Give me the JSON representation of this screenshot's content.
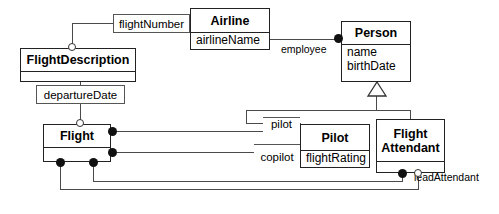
{
  "diagram": {
    "type": "uml-class-diagram",
    "background_color": "#ffffff",
    "line_color": "#4a4a4a",
    "border_color": "#222222"
  },
  "classes": [
    {
      "id": "airline",
      "name": "Airline",
      "attributes": [
        "airlineName"
      ],
      "x": 190,
      "y": 8,
      "w": 80,
      "h": 42,
      "name_h": 21
    },
    {
      "id": "person",
      "name": "Person",
      "attributes": [
        "name",
        "birthDate"
      ],
      "x": 341,
      "y": 21,
      "w": 70,
      "h": 61,
      "name_h": 20
    },
    {
      "id": "flightdescription",
      "name": "FlightDescription",
      "attributes": [],
      "x": 20,
      "y": 48,
      "w": 116,
      "h": 34,
      "name_h": 20
    },
    {
      "id": "flight",
      "name": "Flight",
      "attributes": [],
      "x": 43,
      "y": 124,
      "w": 68,
      "h": 38,
      "name_h": 20
    },
    {
      "id": "pilot",
      "name": "Pilot",
      "attributes": [
        "flightRating"
      ],
      "x": 300,
      "y": 124,
      "w": 70,
      "h": 44,
      "name_h": 23
    },
    {
      "id": "flightattendant",
      "name": "Flight\nAttendant",
      "attributes": [],
      "x": 376,
      "y": 119,
      "w": 69,
      "h": 54,
      "name_h": 39
    }
  ],
  "qualifier_boxes": [
    {
      "id": "flightnumber",
      "label": "flightNumber",
      "x": 113,
      "y": 14,
      "w": 77,
      "h": 19
    },
    {
      "id": "departuredate",
      "label": "departureDate",
      "x": 36,
      "y": 85,
      "w": 89,
      "h": 19
    },
    {
      "id": "pilot_role",
      "label": "pilot",
      "x": 263,
      "y": 117,
      "w": 37,
      "h": 16
    },
    {
      "id": "copilot_role",
      "label": "copilot",
      "x": 254,
      "y": 144,
      "w": 46,
      "h": 19
    }
  ],
  "association_labels": [
    {
      "id": "employee",
      "text": "employee",
      "x": 281,
      "y": 44
    },
    {
      "id": "leadattendant",
      "text": "leadAttendant",
      "x": 414,
      "y": 172
    }
  ],
  "relationships": [
    {
      "from": "Airline",
      "to": "FlightDescription",
      "qualifier": "flightNumber",
      "end": "hollow-circle"
    },
    {
      "from": "Airline",
      "to": "Person",
      "role": "employee",
      "end": "filled-circle"
    },
    {
      "from": "FlightDescription",
      "to": "Flight",
      "qualifier": "departureDate",
      "end": "hollow-circle"
    },
    {
      "from": "Person",
      "to": "Pilot",
      "type": "generalization"
    },
    {
      "from": "Person",
      "to": "FlightAttendant",
      "type": "generalization"
    },
    {
      "from": "Flight",
      "to": "Pilot",
      "role": "pilot",
      "end": "filled-circle"
    },
    {
      "from": "Flight",
      "to": "Pilot",
      "role": "copilot",
      "end": "filled-circle"
    },
    {
      "from": "Flight",
      "to": "FlightAttendant",
      "end": "filled-circle"
    },
    {
      "from": "FlightAttendant",
      "to": "Flight",
      "role": "leadAttendant",
      "end": "hollow-circle"
    }
  ]
}
